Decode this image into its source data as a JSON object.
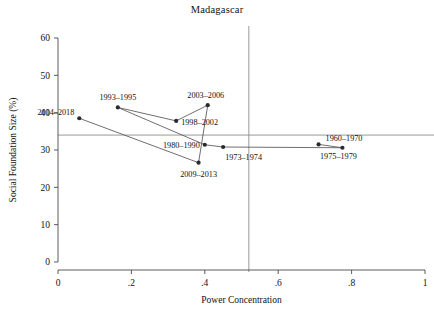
{
  "chart_data": {
    "type": "scatter",
    "title": "Madagascar",
    "xlabel": "Power Concentration",
    "ylabel": "Social Foundation Size (%)",
    "xlim": [
      0,
      1
    ],
    "ylim": [
      0,
      60
    ],
    "xticks": [
      "0",
      ".2",
      ".4",
      ".6",
      ".8",
      "1"
    ],
    "xtick_values": [
      0,
      0.2,
      0.4,
      0.6,
      0.8,
      1
    ],
    "yticks": [
      "0",
      "10",
      "20",
      "30",
      "40",
      "50",
      "60"
    ],
    "ytick_values": [
      0,
      10,
      20,
      30,
      40,
      50,
      60
    ],
    "grid": false,
    "legend": "none",
    "connected": true,
    "reference_lines": {
      "vertical_x": 0.52,
      "horizontal_y": 34.0
    },
    "point_color": "#2a2a30",
    "line_color": "#55555a",
    "reference_line_color": "#8d8d8d",
    "points": [
      {
        "label": "1960–1970",
        "x": 0.71,
        "y": 31.5,
        "label_dx": 7,
        "label_dy": -3,
        "anchor": "start"
      },
      {
        "label": "1975–1979",
        "x": 0.775,
        "y": 30.6,
        "label_dx": -4,
        "label_dy": 11,
        "anchor": "middle"
      },
      {
        "label": "1973–1974",
        "x": 0.45,
        "y": 30.8,
        "label_dx": 2,
        "label_dy": 13,
        "anchor": "start"
      },
      {
        "label": "1980–1990",
        "x": 0.4,
        "y": 31.4,
        "label_dx": -5,
        "label_dy": 3,
        "anchor": "end"
      },
      {
        "label": "1993–1995",
        "x": 0.163,
        "y": 41.4,
        "label_dx": 0,
        "label_dy": -7,
        "anchor": "middle"
      },
      {
        "label": "1998–2002",
        "x": 0.322,
        "y": 37.8,
        "label_dx": 5,
        "label_dy": 4,
        "anchor": "start"
      },
      {
        "label": "2003–2006",
        "x": 0.408,
        "y": 42.0,
        "label_dx": -2,
        "label_dy": -7,
        "anchor": "middle"
      },
      {
        "label": "2009–2013",
        "x": 0.383,
        "y": 26.6,
        "label_dx": 0,
        "label_dy": 14,
        "anchor": "middle"
      },
      {
        "label": "2014–2018",
        "x": 0.058,
        "y": 38.5,
        "label_dx": -5,
        "label_dy": -3,
        "anchor": "end"
      }
    ],
    "path_order": [
      "1960–1970",
      "1975–1979",
      "1973–1974",
      "1980–1990",
      "1993–1995",
      "1998–2002",
      "2003–2006",
      "2009–2013",
      "2014–2018"
    ]
  }
}
